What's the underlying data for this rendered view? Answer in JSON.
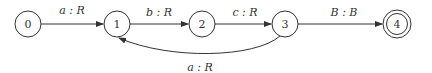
{
  "diagram": {
    "type": "finite-state-transducer",
    "nodes": [
      {
        "id": "0",
        "label": "0",
        "accepting": false
      },
      {
        "id": "1",
        "label": "1",
        "accepting": false
      },
      {
        "id": "2",
        "label": "2",
        "accepting": false
      },
      {
        "id": "3",
        "label": "3",
        "accepting": false
      },
      {
        "id": "4",
        "label": "4",
        "accepting": true
      }
    ],
    "edges": [
      {
        "from": "0",
        "to": "1",
        "label": "a : R"
      },
      {
        "from": "1",
        "to": "2",
        "label": "b : R"
      },
      {
        "from": "2",
        "to": "3",
        "label": "c : R"
      },
      {
        "from": "3",
        "to": "4",
        "label": "B : B"
      },
      {
        "from": "3",
        "to": "1",
        "label": "a : R"
      }
    ]
  }
}
